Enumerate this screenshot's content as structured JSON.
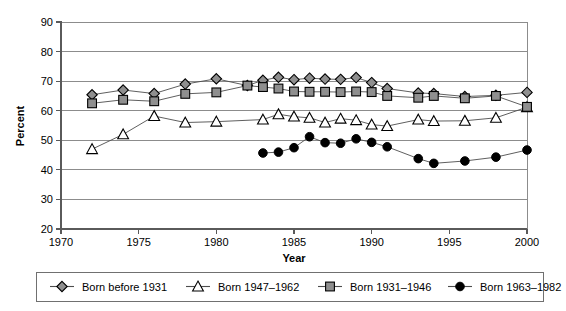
{
  "chart_data": {
    "type": "line",
    "title": "",
    "xlabel": "Year",
    "ylabel": "Percent",
    "xlim": [
      1970,
      2000
    ],
    "ylim": [
      20,
      90
    ],
    "xticks": [
      1970,
      1975,
      1980,
      1985,
      1990,
      1995,
      2000
    ],
    "yticks": [
      20,
      30,
      40,
      50,
      60,
      70,
      80,
      90
    ],
    "grid": "horizontal",
    "legend_position": "below",
    "series": [
      {
        "name": "Born before 1931",
        "marker": "diamond-filled-gray",
        "x": [
          1972,
          1974,
          1976,
          1978,
          1980,
          1982,
          1983,
          1984,
          1985,
          1986,
          1987,
          1988,
          1989,
          1990,
          1991,
          1993,
          1994,
          1996,
          1998,
          2000
        ],
        "values": [
          65.4,
          67.0,
          65.8,
          69.0,
          70.8,
          68.5,
          70.3,
          71.3,
          70.5,
          71.0,
          70.7,
          70.6,
          71.2,
          69.5,
          67.5,
          66.0,
          65.8,
          64.8,
          65.2,
          66.2
        ]
      },
      {
        "name": "Born 1947–1962",
        "marker": "triangle-open",
        "x": [
          1972,
          1974,
          1976,
          1978,
          1980,
          1983,
          1984,
          1985,
          1986,
          1987,
          1988,
          1989,
          1990,
          1991,
          1993,
          1994,
          1996,
          1998,
          2000
        ],
        "values": [
          47.0,
          52.0,
          58.2,
          56.0,
          56.3,
          57.0,
          58.8,
          58.0,
          57.6,
          56.0,
          57.3,
          56.8,
          55.3,
          54.8,
          57.0,
          56.5,
          56.6,
          57.6,
          61.2
        ]
      },
      {
        "name": "Born 1931–1946",
        "marker": "square-filled-gray",
        "x": [
          1972,
          1974,
          1976,
          1978,
          1980,
          1982,
          1983,
          1984,
          1985,
          1986,
          1987,
          1988,
          1989,
          1990,
          1991,
          1993,
          1994,
          1996,
          1998,
          2000
        ],
        "values": [
          62.5,
          63.7,
          63.2,
          65.7,
          66.2,
          68.5,
          68.0,
          67.5,
          66.5,
          66.4,
          66.4,
          66.3,
          66.5,
          66.3,
          65.0,
          64.4,
          65.0,
          64.2,
          65.0,
          61.3
        ]
      },
      {
        "name": "Born 1963–1982",
        "marker": "circle-filled-black",
        "x": [
          1983,
          1984,
          1985,
          1986,
          1987,
          1988,
          1989,
          1990,
          1991,
          1993,
          1994,
          1996,
          1998,
          2000
        ],
        "values": [
          45.7,
          46.0,
          47.5,
          51.2,
          49.2,
          49.0,
          50.5,
          49.3,
          47.8,
          43.8,
          42.2,
          43.0,
          44.3,
          46.7
        ]
      }
    ]
  },
  "legend": {
    "entries": [
      {
        "label": "Born before 1931",
        "marker": "diamond-filled-gray"
      },
      {
        "label": "Born 1947–1962",
        "marker": "triangle-open"
      },
      {
        "label": "Born 1931–1946",
        "marker": "square-filled-gray"
      },
      {
        "label": "Born 1963–1982",
        "marker": "circle-filled-black"
      }
    ]
  },
  "colors": {
    "marker_gray": "#8f8f8f",
    "marker_black": "#000000",
    "marker_open": "#ffffff",
    "line": "#4d4d4d",
    "grid": "#8c8c8c",
    "axis": "#5a5a5a",
    "background": "#ffffff"
  }
}
